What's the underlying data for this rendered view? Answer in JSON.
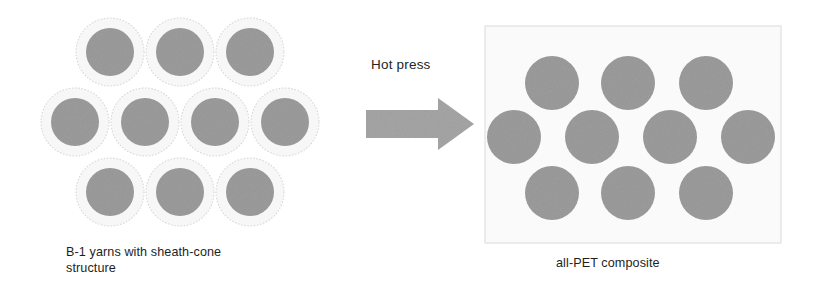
{
  "figure": {
    "width": 824,
    "height": 298,
    "background_color": "#ffffff",
    "process_label": "Hot press",
    "arrow_icon": "right-arrow-icon",
    "left_caption_line1": "B-1 yarns with sheath-cone",
    "left_caption_line2": "structure",
    "right_caption": "all-PET composite"
  },
  "colors": {
    "core_gray": "#9c9c9c",
    "sheath_white": "#f7f7f7",
    "sheath_outline": "#d8d8d8",
    "arrow_gray": "#a6a6a6",
    "panel_background": "#fafafa",
    "panel_border": "#e3e3e3",
    "text_color": "#1e1e1e"
  },
  "left_panel": {
    "name": "B-1 yarn bundle",
    "description": "Hexagonally packed sheath-core yarns before consolidation",
    "yarn_count": 10,
    "core_radius": 24,
    "sheath_radius": 34,
    "rows": [
      {
        "row": 1,
        "count": 3,
        "cy": 44,
        "cx": [
          70,
          140,
          210
        ]
      },
      {
        "row": 2,
        "count": 4,
        "cy": 114,
        "cx": [
          35,
          105,
          175,
          245
        ]
      },
      {
        "row": 3,
        "count": 3,
        "cy": 184,
        "cx": [
          70,
          140,
          210
        ]
      }
    ]
  },
  "right_panel": {
    "name": "all-PET composite",
    "description": "Consolidated matrix with embedded PET fibre cross-sections",
    "fibre_count": 10,
    "fibre_radius": 27,
    "rows": [
      {
        "row": 1,
        "count": 3,
        "cy": 58,
        "cx": [
          68,
          144,
          222
        ]
      },
      {
        "row": 2,
        "count": 4,
        "cy": 112,
        "cx": [
          30,
          108,
          186,
          264
        ]
      },
      {
        "row": 3,
        "count": 3,
        "cy": 168,
        "cx": [
          68,
          144,
          222
        ]
      }
    ]
  }
}
